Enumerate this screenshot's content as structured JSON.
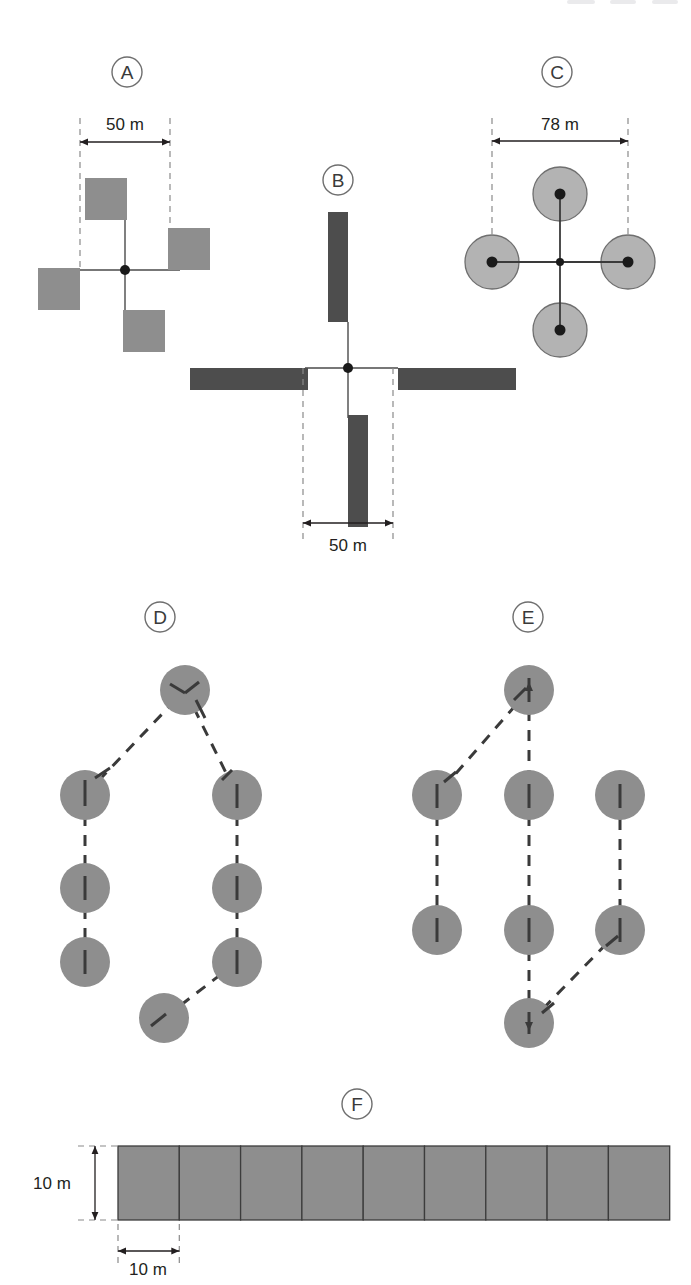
{
  "figure": {
    "width": 691,
    "height": 1285,
    "background_color": "#ffffff"
  },
  "colors": {
    "light_gray_fill": "#8e8e8e",
    "light_gray_fill_alt": "#9a9a9a",
    "pale_gray_fill": "#b3b3b3",
    "dark_fill": "#4d4d4d",
    "outline": "#404040",
    "dashed_guide": "#8a8a8a",
    "dashed_path": "#3a3a3a",
    "dimension_line": "#231f20",
    "letter_circle_stroke": "#6e6e6e",
    "letter_text": "#3a3a3a",
    "center_dot": "#1a1a1a"
  },
  "panels": [
    {
      "id": "A",
      "label": "A",
      "label_center": {
        "x": 127,
        "y": 72
      },
      "design": "four-offset-square-subplots-on-cross-axes",
      "center": {
        "x": 125,
        "y": 270
      },
      "dimension": {
        "text": "50 m",
        "text_pos": {
          "x": 125,
          "y": 128
        },
        "arrow_y": 142,
        "x_start": 80,
        "x_end": 170,
        "guide_top": 118,
        "guide_bottom": 270
      },
      "squares": [
        {
          "name": "north-subplot",
          "x": 85,
          "y": 178,
          "w": 42,
          "h": 42
        },
        {
          "name": "east-subplot",
          "x": 168,
          "y": 228,
          "w": 42,
          "h": 42
        },
        {
          "name": "south-subplot",
          "x": 123,
          "y": 310,
          "w": 42,
          "h": 42
        },
        {
          "name": "west-subplot",
          "x": 38,
          "y": 268,
          "w": 42,
          "h": 42
        }
      ],
      "axes": {
        "vertical": {
          "x": 125,
          "y1": 220,
          "y2": 320
        },
        "horizontal": {
          "y": 270,
          "x1": 75,
          "x2": 180
        }
      }
    },
    {
      "id": "B",
      "label": "B",
      "label_center": {
        "x": 338,
        "y": 180
      },
      "design": "four-offset-rectangular-transects-on-cross-axes",
      "center": {
        "x": 348,
        "y": 368
      },
      "dimension": {
        "text": "50 m",
        "text_pos": {
          "x": 348,
          "y": 549
        },
        "arrow_y": 523,
        "x_start": 303,
        "x_end": 393,
        "guide_top": 368,
        "guide_bottom": 540
      },
      "bars": [
        {
          "name": "north-transect",
          "x": 328,
          "y": 212,
          "w": 20,
          "h": 110
        },
        {
          "name": "east-transect",
          "x": 398,
          "y": 368,
          "w": 118,
          "h": 22
        },
        {
          "name": "south-transect",
          "x": 348,
          "y": 415,
          "w": 20,
          "h": 112
        },
        {
          "name": "west-transect",
          "x": 190,
          "y": 368,
          "w": 118,
          "h": 22
        }
      ],
      "axes": {
        "vertical": {
          "x": 348,
          "y1": 322,
          "y2": 418
        },
        "horizontal": {
          "y": 368,
          "x1": 305,
          "x2": 398
        }
      }
    },
    {
      "id": "C",
      "label": "C",
      "label_center": {
        "x": 557,
        "y": 72
      },
      "design": "four-circular-subplots-on-cross-axes",
      "center": {
        "x": 560,
        "y": 262
      },
      "subplot_radius": 27,
      "dimension": {
        "text": "78 m",
        "text_pos": {
          "x": 560,
          "y": 128
        },
        "arrow_y": 141,
        "x_start": 492,
        "x_end": 628,
        "guide_top": 118,
        "guide_bottom": 262
      },
      "circles": [
        {
          "name": "north-circle",
          "cx": 560,
          "cy": 194
        },
        {
          "name": "east-circle",
          "cx": 628,
          "cy": 262
        },
        {
          "name": "south-circle",
          "cx": 560,
          "cy": 330
        },
        {
          "name": "west-circle",
          "cx": 492,
          "cy": 262
        }
      ],
      "axes": {
        "vertical": {
          "x": 560,
          "y1": 194,
          "y2": 330
        },
        "horizontal": {
          "y": 262,
          "x1": 492,
          "x2": 628
        }
      }
    },
    {
      "id": "D",
      "label": "D",
      "label_center": {
        "x": 160,
        "y": 617
      },
      "design": "eight-circular-subplots-loop-transect",
      "subplot_radius": 25,
      "circles": [
        {
          "name": "plot-1",
          "cx": 185,
          "cy": 690
        },
        {
          "name": "plot-2",
          "cx": 237,
          "cy": 795
        },
        {
          "name": "plot-3",
          "cx": 237,
          "cy": 888
        },
        {
          "name": "plot-4",
          "cx": 237,
          "cy": 962
        },
        {
          "name": "plot-5",
          "cx": 164,
          "cy": 1018
        },
        {
          "name": "plot-6",
          "cx": 85,
          "cy": 962
        },
        {
          "name": "plot-7",
          "cx": 85,
          "cy": 888
        },
        {
          "name": "plot-8",
          "cx": 85,
          "cy": 795
        }
      ],
      "path_order": [
        0,
        1,
        2,
        3,
        4,
        5,
        6,
        7,
        0
      ]
    },
    {
      "id": "E",
      "label": "E",
      "label_center": {
        "x": 528,
        "y": 617
      },
      "design": "eight-circular-subplots-serpentine-transect",
      "subplot_radius": 25,
      "circles": [
        {
          "name": "plot-1",
          "cx": 529,
          "cy": 690
        },
        {
          "name": "plot-2",
          "cx": 437,
          "cy": 795
        },
        {
          "name": "plot-3",
          "cx": 437,
          "cy": 930
        },
        {
          "name": "plot-4",
          "cx": 529,
          "cy": 795
        },
        {
          "name": "plot-5",
          "cx": 529,
          "cy": 930
        },
        {
          "name": "plot-6",
          "cx": 529,
          "cy": 1023
        },
        {
          "name": "plot-7",
          "cx": 620,
          "cy": 930
        },
        {
          "name": "plot-8",
          "cx": 620,
          "cy": 795
        }
      ],
      "path_segments": [
        {
          "from": 0,
          "to": 1
        },
        {
          "from": 1,
          "to": 2
        },
        {
          "from": 0,
          "to": 3
        },
        {
          "from": 3,
          "to": 4
        },
        {
          "from": 4,
          "to": 5
        },
        {
          "from": 5,
          "to": 6
        },
        {
          "from": 6,
          "to": 7
        }
      ]
    },
    {
      "id": "F",
      "label": "F",
      "label_center": {
        "x": 357,
        "y": 1104
      },
      "design": "contiguous-square-quadrat-belt-transect",
      "strip": {
        "x": 118,
        "y": 1146,
        "cell_width": 61.3,
        "cell_height": 74,
        "cell_count": 9
      },
      "dimension_height": {
        "text": "10 m",
        "text_pos": {
          "x": 52,
          "y": 1189
        },
        "arrow_x": 95,
        "y_top": 1146,
        "y_bottom": 1220,
        "guide_x_start": 78,
        "guide_x_end": 122
      },
      "dimension_width": {
        "text": "10 m",
        "text_pos": {
          "x": 148,
          "y": 1273
        },
        "arrow_y": 1251,
        "x_start": 118,
        "x_end": 179,
        "guide_top": 1224,
        "guide_bottom": 1266
      }
    }
  ],
  "scan_artifacts": [
    {
      "left": 567,
      "width": 28
    },
    {
      "left": 610,
      "width": 26
    },
    {
      "left": 652,
      "width": 26
    }
  ]
}
